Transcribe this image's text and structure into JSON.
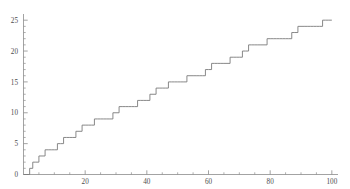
{
  "chart_data": {
    "type": "line",
    "subtype": "step",
    "title": "",
    "subtitle": "",
    "xlabel": "",
    "ylabel": "",
    "xlim": [
      0,
      102
    ],
    "ylim": [
      0,
      26
    ],
    "grid": false,
    "legend": null,
    "legend_position": "none",
    "annotations": [],
    "line_color": "#7a7a7a",
    "axis_color": "#8c8c8c",
    "tick_label_color": "#4d4d4d",
    "x_ticks_major": [
      20,
      40,
      60,
      80,
      100
    ],
    "x_tick_labels": [
      "20",
      "40",
      "60",
      "80",
      "100"
    ],
    "x_ticks_minor": [
      5,
      10,
      15,
      25,
      30,
      35,
      45,
      50,
      55,
      65,
      70,
      75,
      85,
      90,
      95
    ],
    "y_ticks_major": [
      0,
      5,
      10,
      15,
      20,
      25
    ],
    "y_tick_labels": [
      "0",
      "5",
      "10",
      "15",
      "20",
      "25"
    ],
    "y_ticks_minor": [
      1,
      2,
      3,
      4,
      6,
      7,
      8,
      9,
      11,
      12,
      13,
      14,
      16,
      17,
      18,
      19,
      21,
      22,
      23,
      24
    ],
    "series": [
      {
        "name": "cumulative-step-count",
        "x": [
          0,
          1,
          2,
          3,
          4,
          5,
          6,
          7,
          8,
          9,
          10,
          11,
          12,
          13,
          14,
          15,
          16,
          17,
          18,
          19,
          20,
          21,
          22,
          23,
          24,
          25,
          26,
          27,
          28,
          29,
          30,
          31,
          32,
          33,
          34,
          35,
          36,
          37,
          38,
          39,
          40,
          41,
          42,
          43,
          44,
          45,
          46,
          47,
          48,
          49,
          50,
          51,
          52,
          53,
          54,
          55,
          56,
          57,
          58,
          59,
          60,
          61,
          62,
          63,
          64,
          65,
          66,
          67,
          68,
          69,
          70,
          71,
          72,
          73,
          74,
          75,
          76,
          77,
          78,
          79,
          80,
          81,
          82,
          83,
          84,
          85,
          86,
          87,
          88,
          89,
          90,
          91,
          92,
          93,
          94,
          95,
          96,
          97,
          98,
          99,
          100
        ],
        "y": [
          0,
          0,
          1,
          2,
          2,
          3,
          3,
          4,
          4,
          4,
          4,
          5,
          5,
          6,
          6,
          6,
          6,
          7,
          7,
          8,
          8,
          8,
          8,
          9,
          9,
          9,
          9,
          9,
          9,
          10,
          10,
          11,
          11,
          11,
          11,
          11,
          11,
          12,
          12,
          12,
          12,
          13,
          13,
          14,
          14,
          14,
          14,
          15,
          15,
          15,
          15,
          15,
          15,
          16,
          16,
          16,
          16,
          16,
          16,
          17,
          17,
          18,
          18,
          18,
          18,
          18,
          18,
          19,
          19,
          19,
          19,
          20,
          20,
          21,
          21,
          21,
          21,
          21,
          21,
          22,
          22,
          22,
          22,
          22,
          22,
          22,
          22,
          23,
          23,
          24,
          24,
          24,
          24,
          24,
          24,
          24,
          24,
          25,
          25,
          25,
          25
        ]
      }
    ]
  },
  "axes": {
    "x_axis_name": "x-axis",
    "y_axis_name": "y-axis"
  }
}
